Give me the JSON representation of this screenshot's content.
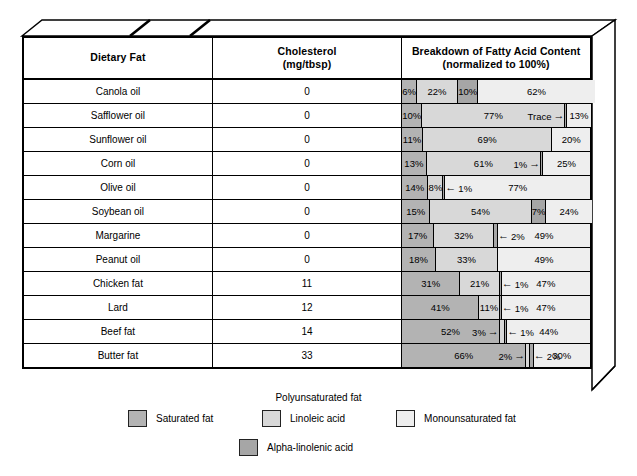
{
  "chart_data": {
    "type": "bar",
    "title": "Breakdown of Fatty Acid Content",
    "subtitle": "(normalized to 100%)",
    "orientation": "horizontal-stacked",
    "xlabel": "",
    "ylabel": "",
    "xlim": [
      0,
      100
    ],
    "grid": false,
    "legend_position": "bottom",
    "columns": [
      "Dietary Fat",
      "Cholesterol (mg/tbsp)",
      "Breakdown of Fatty Acid Content (normalized to 100%)"
    ],
    "series": [
      {
        "name": "Saturated fat",
        "key": "sat",
        "color": "#b3b3b3",
        "values": [
          6,
          10,
          11,
          13,
          14,
          15,
          17,
          18,
          31,
          41,
          52,
          66
        ]
      },
      {
        "name": "Linoleic acid",
        "key": "lin",
        "color": "#d8d8d8",
        "values": [
          22,
          77,
          69,
          61,
          8,
          54,
          32,
          33,
          21,
          11,
          3,
          2
        ]
      },
      {
        "name": "Alpha-linolenic acid",
        "key": "ala",
        "color": "#a6a6a6",
        "values": [
          10,
          0.5,
          0,
          1,
          1,
          7,
          2,
          0,
          1,
          1,
          1,
          2
        ]
      },
      {
        "name": "Monounsaturated fat",
        "key": "mono",
        "color": "#eeeeee",
        "values": [
          62,
          13,
          20,
          25,
          77,
          24,
          49,
          49,
          47,
          47,
          44,
          30
        ]
      }
    ],
    "categories": [
      "Canola oil",
      "Safflower oil",
      "Sunflower oil",
      "Corn oil",
      "Olive oil",
      "Soybean oil",
      "Margarine",
      "Peanut oil",
      "Chicken fat",
      "Lard",
      "Beef fat",
      "Butter fat"
    ],
    "cholesterol_mg_per_tbsp": [
      0,
      0,
      0,
      0,
      0,
      0,
      0,
      0,
      11,
      12,
      14,
      33
    ]
  },
  "header": {
    "col_fat": "Dietary Fat",
    "col_chol_line1": "Cholesterol",
    "col_chol_line2": "(mg/tbsp)",
    "col_break_line1": "Breakdown of Fatty Acid Content",
    "col_break_line2": "(normalized to 100%)"
  },
  "rows": [
    {
      "name": "Canola oil",
      "chol": "0",
      "segments": [
        {
          "cls": "sat",
          "w": 6,
          "label": "6%",
          "pos": "in"
        },
        {
          "cls": "lin",
          "w": 22,
          "label": "22%",
          "pos": "in"
        },
        {
          "cls": "ala",
          "w": 10,
          "label": "10%",
          "pos": "in"
        },
        {
          "cls": "mono",
          "w": 62,
          "label": "62%",
          "pos": "in"
        }
      ]
    },
    {
      "name": "Safflower oil",
      "chol": "0",
      "segments": [
        {
          "cls": "sat",
          "w": 10,
          "label": "10%",
          "pos": "in"
        },
        {
          "cls": "lin",
          "w": 76.3,
          "label": "77%",
          "pos": "in"
        },
        {
          "cls": "ala",
          "w": 0.7,
          "label": "Trace",
          "pos": "left"
        },
        {
          "cls": "mono",
          "w": 13,
          "label": "13%",
          "pos": "in"
        }
      ]
    },
    {
      "name": "Sunflower oil",
      "chol": "0",
      "segments": [
        {
          "cls": "sat",
          "w": 11,
          "label": "11%",
          "pos": "in"
        },
        {
          "cls": "lin",
          "w": 69,
          "label": "69%",
          "pos": "in"
        },
        {
          "cls": "mono",
          "w": 20,
          "label": "20%",
          "pos": "in"
        }
      ]
    },
    {
      "name": "Corn oil",
      "chol": "0",
      "segments": [
        {
          "cls": "sat",
          "w": 13,
          "label": "13%",
          "pos": "in"
        },
        {
          "cls": "lin",
          "w": 61,
          "label": "61%",
          "pos": "in"
        },
        {
          "cls": "ala",
          "w": 1,
          "label": "1%",
          "pos": "left"
        },
        {
          "cls": "mono",
          "w": 25,
          "label": "25%",
          "pos": "in"
        }
      ]
    },
    {
      "name": "Olive oil",
      "chol": "0",
      "segments": [
        {
          "cls": "sat",
          "w": 14,
          "label": "14%",
          "pos": "in"
        },
        {
          "cls": "lin",
          "w": 8,
          "label": "8%",
          "pos": "in"
        },
        {
          "cls": "ala",
          "w": 1,
          "label": "1%",
          "pos": "right"
        },
        {
          "cls": "mono",
          "w": 77,
          "label": "77%",
          "pos": "in"
        }
      ]
    },
    {
      "name": "Soybean oil",
      "chol": "0",
      "segments": [
        {
          "cls": "sat",
          "w": 15,
          "label": "15%",
          "pos": "in"
        },
        {
          "cls": "lin",
          "w": 54,
          "label": "54%",
          "pos": "in"
        },
        {
          "cls": "ala",
          "w": 7,
          "label": "7%",
          "pos": "in"
        },
        {
          "cls": "mono",
          "w": 24,
          "label": "24%",
          "pos": "in"
        }
      ]
    },
    {
      "name": "Margarine",
      "chol": "0",
      "segments": [
        {
          "cls": "sat",
          "w": 17,
          "label": "17%",
          "pos": "in"
        },
        {
          "cls": "lin",
          "w": 32,
          "label": "32%",
          "pos": "in"
        },
        {
          "cls": "ala",
          "w": 2,
          "label": "2%",
          "pos": "right"
        },
        {
          "cls": "mono",
          "w": 49,
          "label": "49%",
          "pos": "in"
        }
      ]
    },
    {
      "name": "Peanut oil",
      "chol": "0",
      "segments": [
        {
          "cls": "sat",
          "w": 18,
          "label": "18%",
          "pos": "in"
        },
        {
          "cls": "lin",
          "w": 33,
          "label": "33%",
          "pos": "in"
        },
        {
          "cls": "mono",
          "w": 49,
          "label": "49%",
          "pos": "in"
        }
      ]
    },
    {
      "name": "Chicken fat",
      "chol": "11",
      "segments": [
        {
          "cls": "sat",
          "w": 31,
          "label": "31%",
          "pos": "in"
        },
        {
          "cls": "lin",
          "w": 21,
          "label": "21%",
          "pos": "in"
        },
        {
          "cls": "ala",
          "w": 1,
          "label": "1%",
          "pos": "right"
        },
        {
          "cls": "mono",
          "w": 47,
          "label": "47%",
          "pos": "in"
        }
      ]
    },
    {
      "name": "Lard",
      "chol": "12",
      "segments": [
        {
          "cls": "sat",
          "w": 41,
          "label": "41%",
          "pos": "in"
        },
        {
          "cls": "lin",
          "w": 11,
          "label": "11%",
          "pos": "in"
        },
        {
          "cls": "ala",
          "w": 1,
          "label": "1%",
          "pos": "right"
        },
        {
          "cls": "mono",
          "w": 47,
          "label": "47%",
          "pos": "in"
        }
      ]
    },
    {
      "name": "Beef fat",
      "chol": "14",
      "segments": [
        {
          "cls": "sat",
          "w": 52,
          "label": "52%",
          "pos": "in"
        },
        {
          "cls": "lin",
          "w": 3,
          "label": "3%",
          "pos": "left"
        },
        {
          "cls": "ala",
          "w": 1,
          "label": "1%",
          "pos": "right"
        },
        {
          "cls": "mono",
          "w": 44,
          "label": "44%",
          "pos": "in"
        }
      ]
    },
    {
      "name": "Butter fat",
      "chol": "33",
      "segments": [
        {
          "cls": "sat",
          "w": 66,
          "label": "66%",
          "pos": "in"
        },
        {
          "cls": "lin",
          "w": 2,
          "label": "2%",
          "pos": "left"
        },
        {
          "cls": "ala",
          "w": 2,
          "label": "2%",
          "pos": "right"
        },
        {
          "cls": "mono",
          "w": 30,
          "label": "30%",
          "pos": "in"
        }
      ]
    }
  ],
  "legend": {
    "poly_group_title": "Polyunsaturated fat",
    "saturated": "Saturated fat",
    "linoleic": "Linoleic acid",
    "monounsaturated": "Monounsaturated fat",
    "alpha_linolenic": "Alpha-linolenic acid"
  },
  "colors": {
    "saturated": "#b3b3b3",
    "linoleic": "#d8d8d8",
    "alpha_linolenic": "#a6a6a6",
    "monounsaturated": "#eeeeee",
    "outline": "#000000",
    "background": "#ffffff"
  }
}
